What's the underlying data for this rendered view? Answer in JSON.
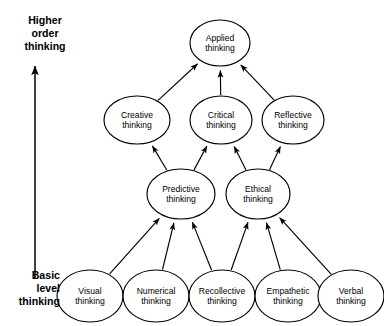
{
  "diagram": {
    "colors": {
      "stroke": "#000000",
      "node_fill": "#ffffff",
      "background": "#ffffff",
      "text": "#000000"
    },
    "axis": {
      "top_label_lines": [
        "Higher",
        "order",
        "thinking"
      ],
      "bottom_label_lines": [
        "Basic",
        "level",
        "thinking"
      ],
      "arrow_direction": "upward"
    },
    "nodes": [
      {
        "id": "applied",
        "line1": "Applied",
        "line2": "thinking",
        "cx": 220,
        "cy": 43,
        "rx": 30,
        "ry": 23,
        "tier": 1
      },
      {
        "id": "creative",
        "line1": "Creative",
        "line2": "thinking",
        "cx": 137,
        "cy": 120,
        "rx": 33,
        "ry": 24,
        "tier": 2
      },
      {
        "id": "critical",
        "line1": "Critical",
        "line2": "thinking",
        "cx": 221,
        "cy": 120,
        "rx": 31,
        "ry": 24,
        "tier": 2
      },
      {
        "id": "reflective",
        "line1": "Reflective",
        "line2": "thinking",
        "cx": 293,
        "cy": 120,
        "rx": 31,
        "ry": 24,
        "tier": 2
      },
      {
        "id": "predictive",
        "line1": "Predictive",
        "line2": "thinking",
        "cx": 181,
        "cy": 194,
        "rx": 34,
        "ry": 25,
        "tier": 3
      },
      {
        "id": "ethical",
        "line1": "Ethical",
        "line2": "thinking",
        "cx": 258,
        "cy": 194,
        "rx": 32,
        "ry": 25,
        "tier": 3
      },
      {
        "id": "visual",
        "line1": "Visual",
        "line2": "thinking",
        "cx": 90,
        "cy": 296,
        "rx": 33,
        "ry": 26,
        "tier": 4
      },
      {
        "id": "numerical",
        "line1": "Numerical",
        "line2": "thinking",
        "cx": 156,
        "cy": 296,
        "rx": 33,
        "ry": 26,
        "tier": 4
      },
      {
        "id": "recollective",
        "line1": "Recollective",
        "line2": "thinking",
        "cx": 222,
        "cy": 296,
        "rx": 33,
        "ry": 26,
        "tier": 4
      },
      {
        "id": "empathetic",
        "line1": "Empathetic",
        "line2": "thinking",
        "cx": 288,
        "cy": 296,
        "rx": 33,
        "ry": 26,
        "tier": 4
      },
      {
        "id": "verbal",
        "line1": "Verbal",
        "line2": "thinking",
        "cx": 351,
        "cy": 296,
        "rx": 33,
        "ry": 26,
        "tier": 4
      }
    ],
    "edges": [
      {
        "from": "creative",
        "to": "applied"
      },
      {
        "from": "critical",
        "to": "applied"
      },
      {
        "from": "reflective",
        "to": "applied"
      },
      {
        "from": "predictive",
        "to": "creative"
      },
      {
        "from": "predictive",
        "to": "critical"
      },
      {
        "from": "ethical",
        "to": "critical"
      },
      {
        "from": "ethical",
        "to": "reflective"
      },
      {
        "from": "visual",
        "to": "predictive"
      },
      {
        "from": "numerical",
        "to": "predictive"
      },
      {
        "from": "recollective",
        "to": "predictive"
      },
      {
        "from": "recollective",
        "to": "ethical"
      },
      {
        "from": "empathetic",
        "to": "ethical"
      },
      {
        "from": "verbal",
        "to": "ethical"
      }
    ]
  }
}
